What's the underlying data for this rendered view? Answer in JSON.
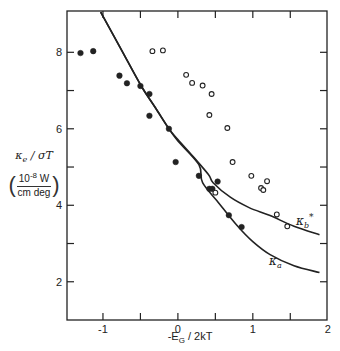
{
  "chart_data": {
    "type": "scatter",
    "title": "",
    "xlabel": "-E_G / 2kT",
    "ylabel": "κe / σT (10^-8 W / cm deg)",
    "xlim": [
      -1.48,
      1.99
    ],
    "ylim": [
      1.0,
      9.08
    ],
    "x_ticks_labeled": [
      -1,
      0,
      1,
      2
    ],
    "x_ticks_minor": [
      -1.5,
      -0.5,
      0.5,
      1.5
    ],
    "y_ticks_labeled": [
      2,
      4,
      6,
      8
    ],
    "y_ticks_minor": [
      3,
      5,
      7
    ],
    "grid": false,
    "series": [
      {
        "name": "filled circles",
        "marker": "filled-circle",
        "points": [
          [
            -1.3,
            7.98
          ],
          [
            -1.13,
            8.03
          ],
          [
            -0.78,
            7.39
          ],
          [
            -0.68,
            7.19
          ],
          [
            -0.5,
            7.12
          ],
          [
            -0.38,
            6.91
          ],
          [
            -0.38,
            6.34
          ],
          [
            -0.12,
            6.0
          ],
          [
            -0.03,
            5.13
          ],
          [
            0.28,
            4.77
          ],
          [
            0.53,
            4.62
          ],
          [
            0.42,
            4.43
          ],
          [
            0.46,
            4.43
          ],
          [
            0.68,
            3.74
          ],
          [
            0.85,
            3.43
          ]
        ]
      },
      {
        "name": "open circles",
        "marker": "open-circle",
        "points": [
          [
            -0.34,
            8.03
          ],
          [
            -0.2,
            8.05
          ],
          [
            0.11,
            7.41
          ],
          [
            0.19,
            7.2
          ],
          [
            0.33,
            7.13
          ],
          [
            0.45,
            6.91
          ],
          [
            0.42,
            6.36
          ],
          [
            0.66,
            6.02
          ],
          [
            0.73,
            5.13
          ],
          [
            0.98,
            4.77
          ],
          [
            1.19,
            4.63
          ],
          [
            1.11,
            4.45
          ],
          [
            1.14,
            4.4
          ],
          [
            0.5,
            4.33
          ],
          [
            1.32,
            3.76
          ],
          [
            1.46,
            3.45
          ]
        ]
      },
      {
        "name": "κa",
        "type": "line",
        "points": [
          [
            -1.03,
            9.05
          ],
          [
            -0.75,
            8.05
          ],
          [
            -0.49,
            7.12
          ],
          [
            -0.3,
            6.55
          ],
          [
            -0.12,
            6.0
          ],
          [
            0.0,
            5.68
          ],
          [
            0.28,
            5.06
          ],
          [
            0.33,
            4.59
          ],
          [
            0.55,
            4.05
          ],
          [
            0.79,
            3.47
          ],
          [
            1.0,
            3.05
          ],
          [
            1.23,
            2.71
          ],
          [
            1.55,
            2.42
          ],
          [
            1.89,
            2.24
          ]
        ]
      },
      {
        "name": "κb*",
        "type": "line",
        "points": [
          [
            -1.03,
            9.05
          ],
          [
            -0.75,
            8.05
          ],
          [
            -0.49,
            7.12
          ],
          [
            -0.3,
            6.55
          ],
          [
            -0.12,
            6.0
          ],
          [
            0.0,
            5.72
          ],
          [
            0.2,
            5.28
          ],
          [
            0.41,
            4.8
          ],
          [
            0.47,
            4.59
          ],
          [
            0.7,
            4.21
          ],
          [
            0.95,
            3.94
          ],
          [
            1.23,
            3.73
          ],
          [
            1.55,
            3.45
          ],
          [
            1.89,
            3.23
          ]
        ]
      }
    ],
    "annotations": [
      {
        "text": "κb*",
        "x": 1.64,
        "y": 4.0
      },
      {
        "text": "κa",
        "x": 1.28,
        "y": 2.9
      }
    ]
  },
  "axes": {
    "x_tick_labels": [
      "-1",
      "0",
      "1",
      "2"
    ],
    "y_tick_labels": [
      "2",
      "4",
      "6",
      "8"
    ],
    "x_label": "-E",
    "x_label_sub": "G",
    "x_label_rest": " / 2kT",
    "y_label_main": "κ",
    "y_label_main_sub": "e",
    "y_label_main_rest": " / σT",
    "y_label_num": "10",
    "y_label_num_exp": "-8",
    "y_label_num_unit": " W",
    "y_label_den": "cm deg"
  },
  "labels": {
    "kb_base": "κ",
    "kb_sub": "b",
    "kb_sup": "*",
    "ka_base": "κ",
    "ka_sub": "a"
  },
  "colors": {
    "ink": "#222222",
    "background": "#ffffff"
  }
}
